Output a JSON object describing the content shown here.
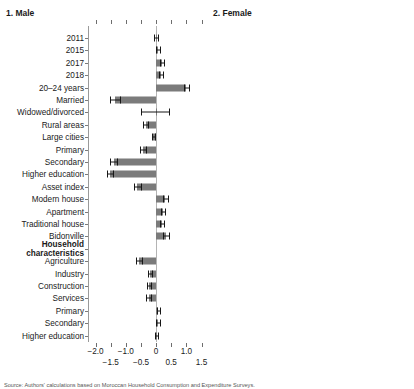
{
  "figure": {
    "source_note": "Source: Authors' calculations based on Moroccan Household Consumption and Expenditure Surveys."
  },
  "chart_data": {
    "type": "bar",
    "orientation": "horizontal",
    "title": "",
    "panels": [
      {
        "id": "male",
        "title": "1. Male",
        "xlabel": "",
        "xlim": [
          -2.25,
          1.45
        ],
        "ticks": [
          -2.0,
          -1.5,
          -1.0,
          -0.5,
          0,
          0.5,
          1.0,
          1.5
        ],
        "tick_labels_upper": [
          "-2.0",
          "-1.0",
          "0",
          "1.0"
        ],
        "tick_labels_lower": [
          "-1.5",
          "-0.5",
          "0.5",
          "1.5"
        ],
        "categories": [
          "2011",
          "2015",
          "2017",
          "2018",
          "20–24 years",
          "Married",
          "Widowed/divorced",
          "Rural areas",
          "Large cities",
          "Primary",
          "Secondary",
          "Higher education",
          "Asset index",
          "Modern house",
          "Apartment",
          "Traditional house",
          "Bidonville",
          "Household characteristics",
          "Agriculture",
          "Industry",
          "Construction",
          "Services",
          "Primary",
          "Secondary",
          "Higher education"
        ],
        "values": [
          0.0,
          0.06,
          0.18,
          0.16,
          1.0,
          -1.35,
          -0.02,
          -0.35,
          -0.1,
          -0.43,
          -1.4,
          -1.52,
          -0.62,
          0.3,
          0.23,
          0.19,
          0.32,
          null,
          -0.56,
          -0.2,
          -0.24,
          -0.25,
          0.07,
          0.06,
          0.01
        ],
        "ci_low": [
          -0.06,
          0.0,
          0.12,
          0.1,
          0.93,
          -1.52,
          -0.5,
          -0.44,
          -0.15,
          -0.53,
          -1.52,
          -1.62,
          -0.74,
          0.22,
          0.15,
          0.12,
          0.22,
          null,
          -0.67,
          -0.27,
          -0.31,
          -0.33,
          0.02,
          0.01,
          -0.04
        ],
        "ci_high": [
          0.06,
          0.12,
          0.25,
          0.23,
          1.08,
          -1.18,
          0.44,
          -0.26,
          -0.04,
          -0.34,
          -1.28,
          -1.42,
          -0.51,
          0.39,
          0.31,
          0.27,
          0.42,
          null,
          -0.45,
          -0.13,
          -0.18,
          -0.17,
          0.13,
          0.12,
          0.06
        ]
      },
      {
        "id": "female",
        "title": "2. Female",
        "xlabel": "",
        "xlim": [
          -2.85,
          2.25
        ],
        "ticks": [
          -2.5,
          -2.0,
          -1.5,
          -1.0,
          -0.5,
          0,
          0.5,
          1.0,
          1.5,
          2.0
        ],
        "tick_labels_upper": [
          "-2.5",
          "-1.5",
          "-0.5",
          "0.5",
          "1.5"
        ],
        "tick_labels_lower": [
          "-2.0",
          "-1.0",
          "0",
          "1.0",
          "2.0"
        ],
        "categories": [
          "2011",
          "2015",
          "2017",
          "2018",
          "20–24 years",
          "Married",
          "Widowed/divorced",
          "Rural areas",
          "Large cities",
          "Primary",
          "Secondary",
          "Higher education",
          "Asset index",
          "Modern house",
          "Apartment",
          "Traditional house",
          "Bidonville",
          "Household characteristics",
          "Agriculture",
          "Industry",
          "Construction",
          "Services",
          "Primary",
          "Secondary",
          "Higher education"
        ],
        "values": [
          0.0,
          -0.02,
          0.1,
          0.08,
          0.94,
          1.44,
          0.7,
          0.1,
          -0.13,
          0.08,
          -0.98,
          -1.22,
          -0.62,
          0.13,
          -0.07,
          0.41,
          0.1,
          null,
          -0.08,
          -0.06,
          -0.05,
          -0.05,
          -0.04,
          -0.04,
          -0.04
        ],
        "ci_low": [
          -0.07,
          -0.09,
          0.03,
          0.01,
          0.83,
          1.33,
          0.48,
          0.04,
          -0.19,
          0.02,
          -1.1,
          -1.33,
          -0.72,
          0.07,
          -0.13,
          0.33,
          0.03,
          null,
          -0.14,
          -0.12,
          -0.11,
          -0.11,
          -0.1,
          -0.1,
          -0.1
        ],
        "ci_high": [
          0.07,
          0.05,
          0.17,
          0.15,
          1.05,
          1.57,
          1.05,
          0.17,
          -0.07,
          0.15,
          -0.86,
          -1.11,
          -0.52,
          0.2,
          0.0,
          0.5,
          0.18,
          null,
          -0.02,
          0.0,
          0.01,
          0.01,
          0.02,
          0.02,
          0.02
        ]
      }
    ]
  }
}
